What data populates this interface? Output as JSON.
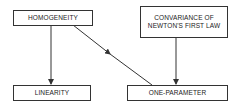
{
  "diagram": {
    "nodes": [
      {
        "id": "homogeneity",
        "label": "HOMOGENEITY"
      },
      {
        "id": "convariance",
        "label_line1": "CONVARIANCE OF",
        "label_line2": "NEWTON'S FIRST LAW"
      },
      {
        "id": "linearity",
        "label": "LINEARITY"
      },
      {
        "id": "one_parameter",
        "label": "ONE-PARAMETER"
      }
    ],
    "edges": [
      {
        "from": "homogeneity",
        "to": "linearity"
      },
      {
        "from": "homogeneity",
        "to": "one_parameter"
      },
      {
        "from": "convariance",
        "to": "one_parameter"
      }
    ],
    "colors": {
      "line": "#333333",
      "text": "#222222",
      "background": "#ffffff"
    }
  }
}
